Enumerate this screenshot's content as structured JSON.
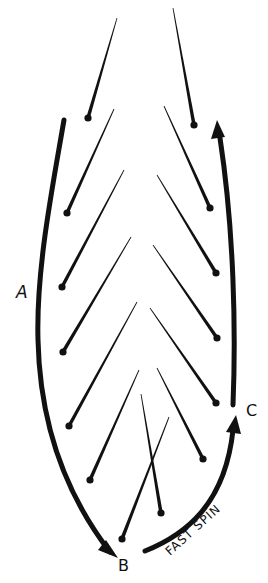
{
  "diagram": {
    "labels": {
      "a": "A",
      "b": "B",
      "c": "C",
      "fast_spin": "FAST SPIN"
    },
    "colors": {
      "ink": "#111111",
      "background": "#ffffff"
    },
    "strokes": [
      {
        "x1": 117,
        "y1": 18,
        "x2": 88,
        "y2": 118,
        "side": "left"
      },
      {
        "x1": 173,
        "y1": 8,
        "x2": 194,
        "y2": 125,
        "side": "right"
      },
      {
        "x1": 114,
        "y1": 109,
        "x2": 67,
        "y2": 213,
        "side": "left"
      },
      {
        "x1": 164,
        "y1": 106,
        "x2": 210,
        "y2": 208,
        "side": "right"
      },
      {
        "x1": 124,
        "y1": 170,
        "x2": 62,
        "y2": 287,
        "side": "left"
      },
      {
        "x1": 157,
        "y1": 175,
        "x2": 216,
        "y2": 273,
        "side": "right"
      },
      {
        "x1": 131,
        "y1": 237,
        "x2": 63,
        "y2": 352,
        "side": "left"
      },
      {
        "x1": 153,
        "y1": 245,
        "x2": 217,
        "y2": 338,
        "side": "right"
      },
      {
        "x1": 137,
        "y1": 302,
        "x2": 69,
        "y2": 426,
        "side": "left"
      },
      {
        "x1": 150,
        "y1": 308,
        "x2": 216,
        "y2": 403,
        "side": "right"
      },
      {
        "x1": 139,
        "y1": 370,
        "x2": 90,
        "y2": 480,
        "side": "left"
      },
      {
        "x1": 157,
        "y1": 368,
        "x2": 203,
        "y2": 459,
        "side": "right"
      },
      {
        "x1": 141,
        "y1": 394,
        "x2": 161,
        "y2": 513,
        "side": "center"
      },
      {
        "x1": 169,
        "y1": 417,
        "x2": 122,
        "y2": 539,
        "side": "center"
      }
    ]
  }
}
